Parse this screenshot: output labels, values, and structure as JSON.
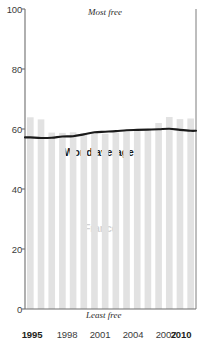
{
  "chart_data": {
    "type": "bar",
    "title": "",
    "xlabel": "",
    "ylabel": "",
    "ylim": [
      0,
      100
    ],
    "xlim": [
      1995,
      2010
    ],
    "grid": false,
    "legend_position": "inline-annotation",
    "categories": [
      "1995",
      "1996",
      "1997",
      "1998",
      "1999",
      "2000",
      "2001",
      "2002",
      "2003",
      "2004",
      "2005",
      "2006",
      "2007",
      "2008",
      "2009",
      "2010"
    ],
    "series": [
      {
        "name": "France",
        "render": "bar",
        "color": "#e2e2e2",
        "values": [
          63.9,
          63.2,
          58.8,
          58.7,
          58.9,
          58.6,
          58.9,
          58.4,
          58.8,
          59.2,
          59.4,
          59.8,
          62.0,
          64.0,
          63.3,
          63.5
        ]
      },
      {
        "name": "World average",
        "render": "line",
        "color": "#1a1a1a",
        "values": [
          57.2,
          57.0,
          57.1,
          57.5,
          57.6,
          58.2,
          58.9,
          59.1,
          59.3,
          59.6,
          59.7,
          59.8,
          59.9,
          60.1,
          59.7,
          59.4
        ]
      }
    ],
    "y_ticks": [
      0,
      20,
      40,
      60,
      80,
      100
    ],
    "x_ticks": [
      {
        "value": "1995",
        "bold": true
      },
      {
        "value": "1998",
        "bold": false
      },
      {
        "value": "2001",
        "bold": false
      },
      {
        "value": "2004",
        "bold": false
      },
      {
        "value": "2007",
        "bold": false
      },
      {
        "value": "2010",
        "bold": true
      }
    ],
    "annotations": [
      {
        "name": "most-free",
        "text": "Most free"
      },
      {
        "name": "least-free",
        "text": "Least free"
      },
      {
        "name": "france-label",
        "text": "France"
      },
      {
        "name": "world-average-label",
        "text": "World average"
      }
    ]
  },
  "labels": {
    "most_free": "Most free",
    "least_free": "Least free",
    "france": "France",
    "world_average": "World average"
  },
  "y_ticks": {
    "t0": "0",
    "t1": "20",
    "t2": "40",
    "t3": "60",
    "t4": "80",
    "t5": "100"
  },
  "x_ticks": {
    "t0": "1995",
    "t1": "1998",
    "t2": "2001",
    "t3": "2004",
    "t4": "2007",
    "t5": "2010"
  },
  "colors": {
    "bar": "#e2e2e2",
    "line": "#1a1a1a",
    "axis": "#6e6e6e",
    "text": "#231f20",
    "france_label": "#d2d2d2"
  }
}
